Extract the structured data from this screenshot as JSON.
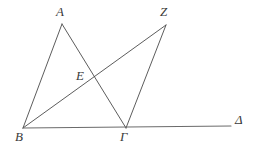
{
  "figure": {
    "kind": "geometry-diagram",
    "width": 258,
    "height": 147,
    "background_color": "#ffffff",
    "stroke_color": "#4a4a4a",
    "baseline_color": "#6b6b6b",
    "label_color": "#3a3a3a",
    "stroke_width": 0.9
  },
  "labels": {
    "a": "A",
    "z": "Z",
    "e": "E",
    "b": "B",
    "gamma": "Γ",
    "delta": "Δ"
  },
  "chart_data": {
    "type": "scatter",
    "title": "",
    "xlabel": "",
    "ylabel": "",
    "grid": false,
    "legend": "none",
    "xlim": [
      0,
      258
    ],
    "ylim": [
      0,
      147
    ],
    "points": [
      {
        "name": "A",
        "x": 62,
        "y": 24,
        "label": "A",
        "label_x": 62,
        "label_y": 12
      },
      {
        "name": "Z",
        "x": 166,
        "y": 25,
        "label": "Z",
        "label_x": 165,
        "label_y": 12
      },
      {
        "name": "E",
        "x": 95,
        "y": 76,
        "label": "E",
        "label_x": 81,
        "label_y": 76
      },
      {
        "name": "B",
        "x": 23,
        "y": 128,
        "label": "B",
        "label_x": 20,
        "label_y": 137
      },
      {
        "name": "Γ",
        "x": 126,
        "y": 128,
        "label": "Γ",
        "label_x": 125,
        "label_y": 137
      },
      {
        "name": "Δ",
        "x": 231,
        "y": 126,
        "label": "Δ",
        "label_x": 240,
        "label_y": 120
      }
    ],
    "segments": [
      {
        "name": "B-A",
        "from": "B",
        "to": "A",
        "x1": 23,
        "y1": 128,
        "x2": 62,
        "y2": 24
      },
      {
        "name": "A-Gamma",
        "from": "A",
        "to": "Γ",
        "x1": 62,
        "y1": 24,
        "x2": 126,
        "y2": 128
      },
      {
        "name": "B-Z",
        "from": "B",
        "to": "Z",
        "x1": 23,
        "y1": 128,
        "x2": 166,
        "y2": 25
      },
      {
        "name": "Z-Gamma",
        "from": "Z",
        "to": "Γ",
        "x1": 166,
        "y1": 25,
        "x2": 126,
        "y2": 128
      },
      {
        "name": "baseline-B-Delta",
        "from": "B",
        "to": "Δ",
        "x1": 23,
        "y1": 128,
        "x2": 231,
        "y2": 126
      }
    ],
    "intersections": [
      {
        "name": "E",
        "of": [
          "A-Gamma",
          "B-Z"
        ],
        "x": 95,
        "y": 76
      }
    ]
  }
}
